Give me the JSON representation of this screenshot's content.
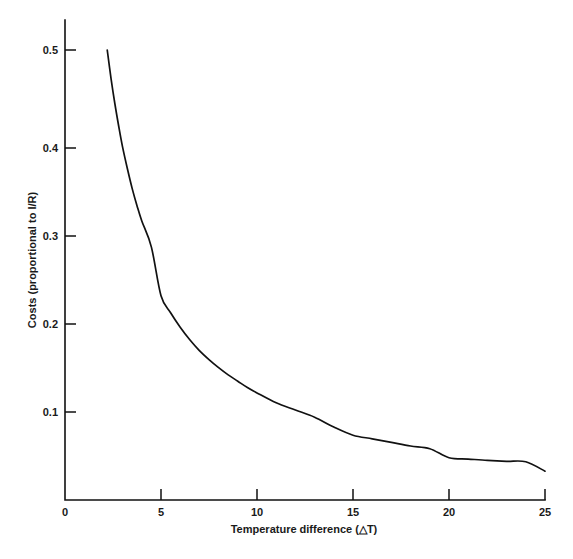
{
  "chart_data": {
    "type": "line",
    "title": "",
    "xlabel": "Temperature difference (△T)",
    "ylabel": "Costs (proportional to I/R)",
    "xlim": [
      0,
      25
    ],
    "ylim": [
      0,
      0.5
    ],
    "grid": false,
    "legend": null,
    "xticks": [
      0,
      5,
      10,
      15,
      20,
      25
    ],
    "xtick_labels": [
      "0",
      "5",
      "10",
      "15",
      "20",
      "25"
    ],
    "yticks": [
      0.1,
      0.2,
      0.3,
      0.4,
      0.5
    ],
    "ytick_labels": [
      "0.1",
      "0.2",
      "0.3",
      "0.4",
      "0.5"
    ],
    "series": [
      {
        "name": "Costs",
        "x": [
          2.2,
          2.4,
          2.6,
          2.8,
          3.0,
          3.25,
          3.5,
          3.75,
          4.0,
          4.5,
          5.0,
          5.5,
          6.0,
          6.5,
          7.0,
          7.5,
          8.0,
          8.5,
          9.0,
          9.5,
          10.0,
          11.0,
          12.0,
          13.0,
          14.0,
          15.0,
          16.0,
          17.0,
          18.0,
          19.0,
          20.0,
          21.0,
          22.0,
          23.0,
          24.0,
          25.0
        ],
        "y": [
          0.5,
          0.468,
          0.44,
          0.415,
          0.392,
          0.368,
          0.346,
          0.327,
          0.31,
          0.281,
          0.227,
          0.208,
          0.192,
          0.178,
          0.166,
          0.156,
          0.147,
          0.139,
          0.132,
          0.125,
          0.119,
          0.108,
          0.1,
          0.092,
          0.081,
          0.072,
          0.068,
          0.064,
          0.06,
          0.057,
          0.047,
          0.0455,
          0.044,
          0.043,
          0.0425,
          0.032
        ]
      }
    ],
    "curve_color": "#111111",
    "axis_color": "#111111",
    "background_color": "#ffffff"
  },
  "axes": {
    "x_axis_label": "Temperature difference (△T)",
    "y_axis_label": "Costs (proportional to I/R)",
    "x_tick_values": [
      "0",
      "5",
      "10",
      "15",
      "20",
      "25"
    ],
    "y_tick_values": [
      "0.1",
      "0.2",
      "0.3",
      "0.4",
      "0.5"
    ]
  }
}
